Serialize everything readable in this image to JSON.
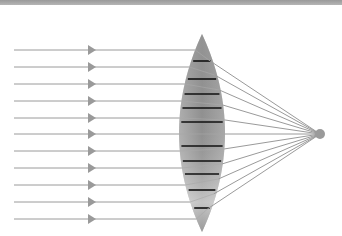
{
  "diagram": {
    "colors": {
      "ray": "#9a9a9a",
      "arrow": "#9a9a9a",
      "lens_dark": "#8a8a8a",
      "lens_light": "#d8d8d8",
      "band": "#111111",
      "focal_point": "#9a9a9a",
      "topbar": "#a8a8a8"
    },
    "rays_y": [
      50,
      67,
      84,
      101,
      118,
      134,
      151,
      168,
      185,
      202,
      219
    ],
    "ray_start_x": 14,
    "arrow_x": 88,
    "lens": {
      "cx": 202,
      "top": 34,
      "bottom": 232,
      "half_width": 23
    },
    "bands_y": [
      61,
      79,
      94,
      108,
      122,
      146,
      161,
      174,
      190,
      208
    ],
    "focal_point": {
      "x": 320,
      "y": 134,
      "r": 5
    }
  }
}
